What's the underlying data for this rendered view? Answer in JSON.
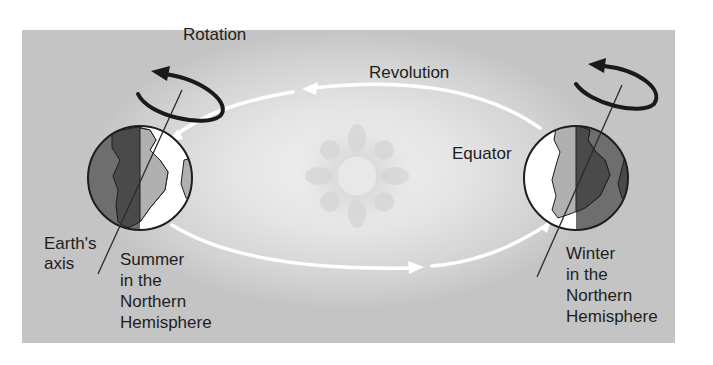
{
  "diagram": {
    "labels": {
      "rotation": "Rotation",
      "revolution": "Revolution",
      "equator": "Equator",
      "earths_axis": [
        "Earth's",
        "axis"
      ],
      "summer": [
        "Summer",
        "in the",
        "Northern",
        "Hemisphere"
      ],
      "winter": [
        "Winter",
        "in the",
        "Northern",
        "Hemisphere"
      ]
    },
    "nodes": [
      {
        "id": "earth-left",
        "label": "Summer in the Northern Hemisphere"
      },
      {
        "id": "sun",
        "label": ""
      },
      {
        "id": "earth-right",
        "label": "Winter in the Northern Hemisphere"
      }
    ],
    "edges": [
      {
        "from": "earth-right",
        "to": "earth-left",
        "label": "Revolution",
        "path": "upper orbit, right to left"
      },
      {
        "from": "earth-left",
        "to": "earth-right",
        "label": "",
        "path": "lower orbit, left to right"
      }
    ],
    "colors": {
      "background_panel": "#d4d4d4",
      "orbit": "#ffffff",
      "rotation_arrow": "#1a1a1a",
      "earth_night": "#6e6e6e",
      "earth_day_land": "#b0b0b0",
      "earth_night_land": "#555555",
      "earth_day_ocean": "#ffffff"
    }
  }
}
